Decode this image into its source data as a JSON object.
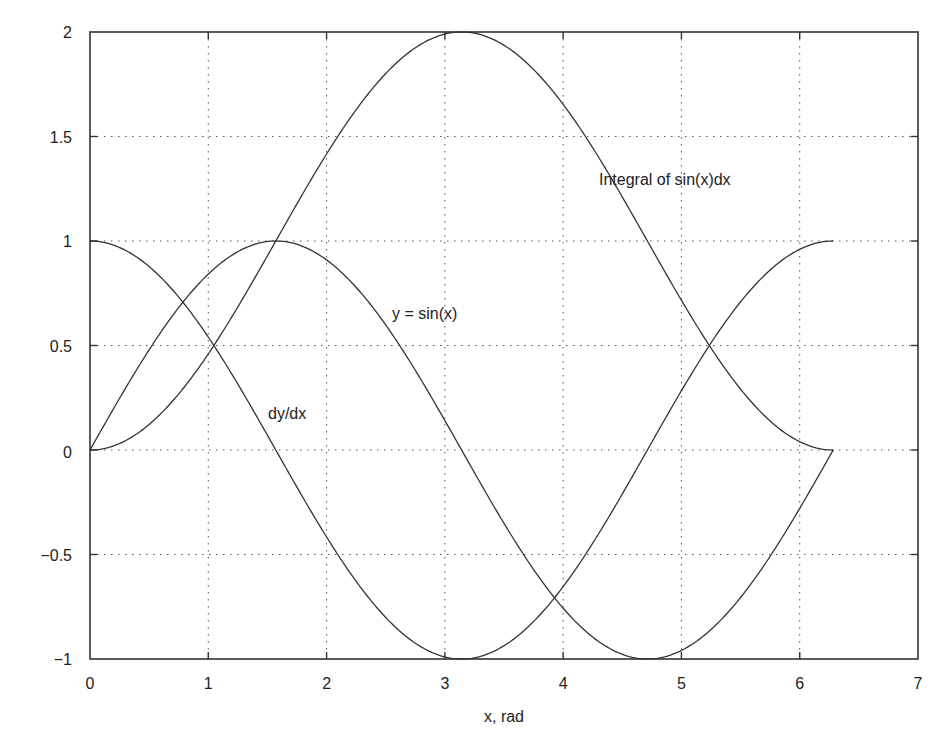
{
  "chart_data": {
    "type": "line",
    "title": "",
    "xlabel": "x, rad",
    "ylabel": "",
    "xlim": [
      0,
      7
    ],
    "ylim": [
      -1,
      2
    ],
    "grid": true,
    "legend": "none (inline annotations)",
    "xticks": [
      "0",
      "1",
      "2",
      "3",
      "4",
      "5",
      "6",
      "7"
    ],
    "yticks": [
      "2",
      "1.5",
      "1",
      "0.5",
      "0",
      "−0.5",
      "−1"
    ],
    "x_range_data": [
      0,
      6.2832
    ],
    "series": [
      {
        "name": "y = sin(x)",
        "function": "sin(x)",
        "x": [
          0,
          0.5,
          1,
          1.5708,
          2,
          2.5,
          3,
          3.1416,
          3.5,
          4,
          4.5,
          4.7124,
          5,
          5.5,
          6,
          6.2832
        ],
        "values": [
          0,
          0.479,
          0.841,
          1.0,
          0.909,
          0.598,
          0.141,
          0,
          -0.351,
          -0.757,
          -0.978,
          -1.0,
          -0.959,
          -0.706,
          -0.279,
          0
        ]
      },
      {
        "name": "dy/dx",
        "function": "cos(x)",
        "x": [
          0,
          0.5,
          1,
          1.5708,
          2,
          2.5,
          3,
          3.1416,
          3.5,
          4,
          4.5,
          4.7124,
          5,
          5.5,
          6,
          6.2832
        ],
        "values": [
          1.0,
          0.878,
          0.54,
          0,
          -0.416,
          -0.801,
          -0.99,
          -1.0,
          -0.936,
          -0.654,
          -0.211,
          0,
          0.284,
          0.709,
          0.96,
          1.0
        ]
      },
      {
        "name": "Integral of sin(x)dx",
        "function": "1 - cos(x)",
        "x": [
          0,
          0.5,
          1,
          1.5708,
          2,
          2.5,
          3,
          3.1416,
          3.5,
          4,
          4.5,
          4.7124,
          5,
          5.5,
          6,
          6.2832
        ],
        "values": [
          0,
          0.122,
          0.46,
          1.0,
          1.416,
          1.801,
          1.99,
          2.0,
          1.936,
          1.654,
          1.211,
          1.0,
          0.716,
          0.291,
          0.04,
          0
        ]
      }
    ],
    "annotations": [
      {
        "text": "Integral of sin(x)dx",
        "x": 4.3,
        "y": 1.38
      },
      {
        "text": "y = sin(x)",
        "x": 2.55,
        "y": 0.66
      },
      {
        "text": "dy/dx",
        "x": 1.5,
        "y": 0.17
      }
    ]
  },
  "labels": {
    "xlabel": "x, rad",
    "xticks": [
      "0",
      "1",
      "2",
      "3",
      "4",
      "5",
      "6",
      "7"
    ],
    "yticks": [
      "2",
      "1.5",
      "1",
      "0.5",
      "0",
      "−0.5",
      "−1"
    ],
    "annot_integral": "Integral of sin(x)dx",
    "annot_sin": "y = sin(x)",
    "annot_deriv": "dy/dx"
  }
}
